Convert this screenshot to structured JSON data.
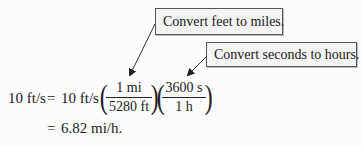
{
  "callouts": [
    {
      "text": "Convert feet to miles.",
      "points_to": "1 mi / 5280 ft"
    },
    {
      "text": "Convert seconds to hours.",
      "points_to": "3600 s / 1 h"
    }
  ],
  "equation": {
    "lhs": "10 ft/s",
    "eq1": "=",
    "rhs_prefix": "10 ft/s",
    "fraction1": {
      "numerator": "1 mi",
      "denominator": "5280 ft"
    },
    "fraction2": {
      "numerator": "3600 s",
      "denominator": "1 h"
    },
    "eq2": "=",
    "result": "6.82 mi/h."
  },
  "parens": {
    "open": "(",
    "close": ")"
  }
}
